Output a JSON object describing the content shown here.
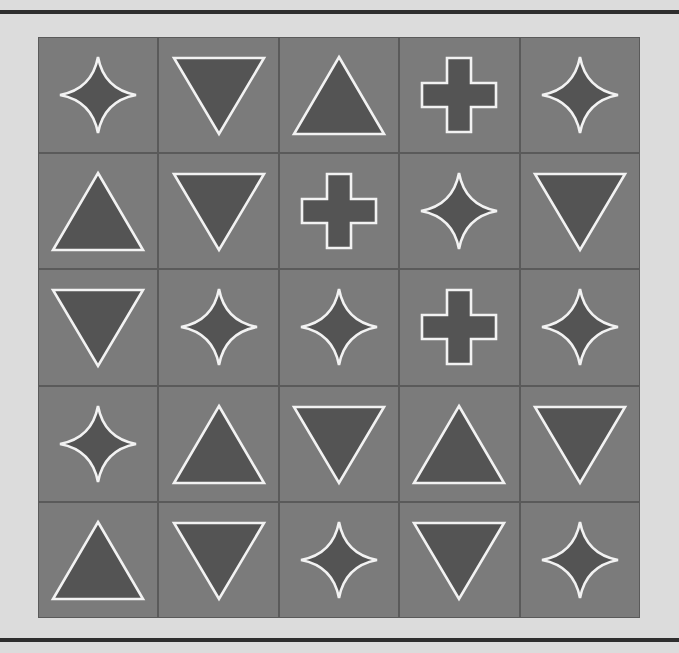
{
  "colors": {
    "page_background": "#dcdcdc",
    "frame_bar": "#2e2e2e",
    "grid_line": "#5a5a5a",
    "cell": "#7b7b7b",
    "shape_fill": "#545454",
    "shape_outline": "#f2f2f2"
  },
  "board": {
    "rows": 5,
    "cols": 5,
    "cells": [
      [
        "star4",
        "triangle-down",
        "triangle-up",
        "plus",
        "star4"
      ],
      [
        "triangle-up",
        "triangle-down",
        "plus",
        "star4",
        "triangle-down"
      ],
      [
        "triangle-down",
        "star4",
        "star4",
        "plus",
        "star4"
      ],
      [
        "star4",
        "triangle-up",
        "triangle-down",
        "triangle-up",
        "triangle-down"
      ],
      [
        "triangle-up",
        "triangle-down",
        "star4",
        "triangle-down",
        "star4"
      ]
    ]
  }
}
